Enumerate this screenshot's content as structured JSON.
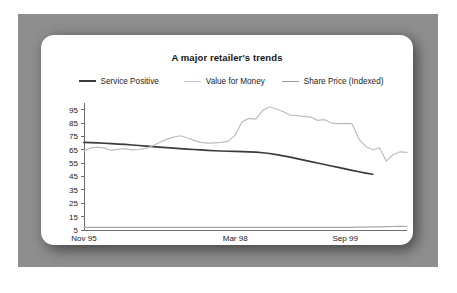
{
  "figure": {
    "frame_color": "#8e8e8e",
    "card_color": "#ffffff",
    "background": "#ffffff"
  },
  "chart_data": {
    "type": "line",
    "title": "A major retailer's trends",
    "xlabel": "",
    "ylabel": "",
    "grid": false,
    "legend_position": "top-center",
    "ylim": [
      5,
      100
    ],
    "yticks": [
      95,
      85,
      75,
      65,
      55,
      45,
      35,
      25,
      15,
      5
    ],
    "xtick_labels": [
      "Nov 95",
      "Mar 98",
      "Sep 99"
    ],
    "xtick_positions": [
      0,
      22,
      38
    ],
    "x_count": 48,
    "series": [
      {
        "name": "Service Positive",
        "color": "#3b3b3b",
        "width": 1.7,
        "values": [
          70.5,
          70.3,
          70.1,
          69.9,
          69.6,
          69.3,
          69.0,
          68.6,
          68.2,
          67.8,
          67.4,
          67.0,
          66.6,
          66.2,
          65.9,
          65.5,
          65.2,
          64.9,
          64.6,
          64.3,
          64.1,
          63.9,
          63.8,
          63.6,
          63.4,
          63.2,
          62.8,
          62.2,
          61.4,
          60.5,
          59.5,
          58.4,
          57.3,
          56.2,
          55.1,
          54.0,
          52.9,
          51.8,
          50.7,
          49.6,
          48.6,
          47.6,
          46.7,
          null,
          null,
          null,
          null,
          null
        ]
      },
      {
        "name": "Value for Money",
        "color": "#bdbdbd",
        "width": 1.2,
        "values": [
          64.0,
          66.5,
          67.0,
          66.2,
          64.5,
          65.5,
          65.8,
          65.0,
          65.2,
          66.0,
          68.0,
          70.5,
          72.8,
          74.5,
          75.5,
          74.0,
          72.0,
          70.5,
          70.0,
          70.2,
          70.5,
          71.5,
          76.0,
          86.0,
          88.5,
          88.0,
          94.5,
          97.0,
          95.5,
          93.5,
          91.0,
          90.5,
          90.0,
          89.5,
          87.0,
          87.5,
          85.0,
          84.5,
          84.8,
          84.5,
          73.0,
          67.5,
          65.0,
          66.5,
          56.5,
          61.5,
          63.5,
          63.0
        ]
      },
      {
        "name": "Share Price (Indexed)",
        "color": "#a8a8a8",
        "width": 1.2,
        "values": [
          7.0,
          7.0,
          7.0,
          7.0,
          7.0,
          7.0,
          7.0,
          7.0,
          7.0,
          7.0,
          7.0,
          7.0,
          7.0,
          7.0,
          7.0,
          7.0,
          7.0,
          7.0,
          7.0,
          7.0,
          7.0,
          7.0,
          7.0,
          7.0,
          7.0,
          7.0,
          7.0,
          7.0,
          7.0,
          7.0,
          7.0,
          7.0,
          7.0,
          7.0,
          7.0,
          7.0,
          7.0,
          7.0,
          7.0,
          7.0,
          7.1,
          7.2,
          7.3,
          7.4,
          7.5,
          7.6,
          7.7,
          7.8
        ]
      }
    ],
    "series_tail_value_for_money": [
      63.5,
      62.0,
      63.0,
      61.5,
      62.5,
      64.0,
      60.0,
      46.0,
      42.0,
      42.5,
      45.5,
      43.5
    ]
  },
  "legend": {
    "items": [
      {
        "label": "Service Positive",
        "color": "#3b3b3b"
      },
      {
        "label": "Value for Money",
        "color": "#c9c9c9"
      },
      {
        "label": "Share Price (Indexed)",
        "color": "#9a9a9a"
      }
    ]
  }
}
